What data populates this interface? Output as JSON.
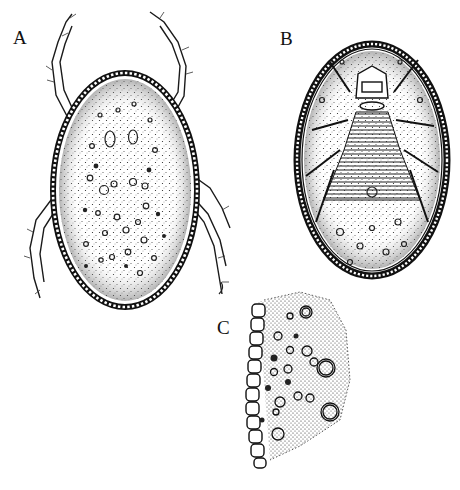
{
  "figure": {
    "panels": [
      {
        "id": "A",
        "label": "A",
        "description": "dorsal view of mite with eight legs"
      },
      {
        "id": "B",
        "label": "B",
        "description": "ventral view of mite"
      },
      {
        "id": "C",
        "label": "C",
        "description": "cross-section of body wall"
      }
    ]
  },
  "colors": {
    "ink": "#1a1a1a",
    "paper": "#ffffff"
  }
}
